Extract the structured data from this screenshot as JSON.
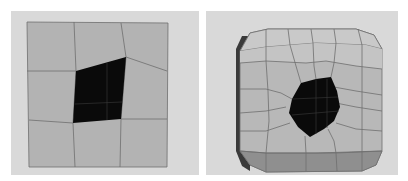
{
  "figure": {
    "panels": [
      {
        "id": "left",
        "label": "Flat grid mesh with quad hole",
        "colors": {
          "background": "#d9d9d9",
          "face": "#b3b3b3",
          "edge": "#6e6e6e",
          "hole": "#0a0a0a"
        }
      },
      {
        "id": "right",
        "label": "Subdivided rounded mesh with smoothed hole",
        "colors": {
          "background": "#d9d9d9",
          "face_top": "#c9c9c9",
          "face_mid": "#b8b8b8",
          "face_bottom": "#8f8f8f",
          "side_dark": "#3a3a3a",
          "edge": "#6e6e6e",
          "hole": "#0a0a0a"
        }
      }
    ]
  }
}
